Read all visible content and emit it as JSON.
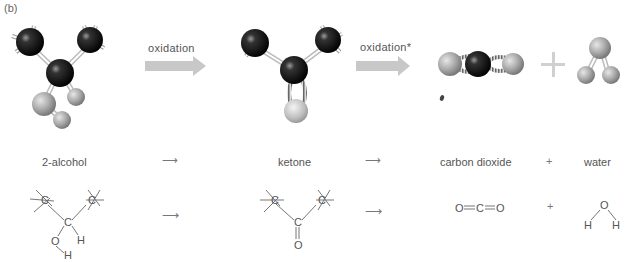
{
  "panel_label": "(b)",
  "arrows": [
    {
      "label": "oxidation"
    },
    {
      "label": "oxidation*"
    }
  ],
  "compounds": [
    {
      "name": "2-alcohol",
      "formula_atoms": [
        "C",
        "C",
        "C",
        "O",
        "H",
        "H"
      ]
    },
    {
      "name": "ketone",
      "formula_atoms": [
        "C",
        "C",
        "C",
        "O"
      ]
    },
    {
      "name": "carbon dioxide",
      "formula": "O=C=O"
    },
    {
      "name": "water",
      "formula_atoms": [
        "O",
        "H",
        "H"
      ]
    }
  ],
  "operators": {
    "reaction_arrow": "⟶",
    "plus": "+"
  },
  "structural": {
    "carbon": "C",
    "oxygen": "O",
    "hydrogen": "H",
    "co2": {
      "o_left": "O",
      "c": "C",
      "o_right": "O"
    }
  },
  "colors": {
    "carbon_ball": "#111111",
    "oxygen_ball": "#9a9a9a",
    "arrow_fill": "#c8c8c8",
    "text": "#555555"
  }
}
